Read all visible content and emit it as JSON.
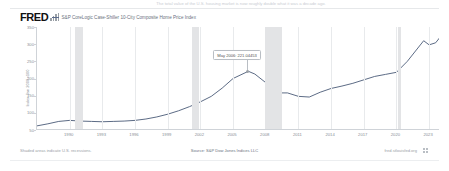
{
  "top_caption": "The total value of the U.S. housing market is now roughly double what it was a decade ago.",
  "header": {
    "logo_text": "FRED",
    "logo_icon": "bar-chart-icon",
    "legend": [
      {
        "label": "S&P CoreLogic Case-Shiller 10-City Composite Home Price Index",
        "color": "#5b6b8c"
      }
    ]
  },
  "annotation": {
    "text": "May 2006: 221.04453"
  },
  "footer": {
    "left": "Shaded areas indicate U.S. recessions.",
    "center": "Source: S&P Dow Jones Indices LLC",
    "right": "fred.stlouisfed.org",
    "icon": "fred-grid-icon"
  },
  "chart_data": {
    "type": "line",
    "title": "S&P CoreLogic Case-Shiller 10-City Composite Home Price Index",
    "xlabel": "",
    "ylabel": "Index Jan 2000=100",
    "ylim": [
      50,
      350
    ],
    "yticks": [
      50,
      100,
      150,
      200,
      250,
      300,
      350
    ],
    "xlim": [
      1987,
      2024
    ],
    "xticks": [
      1990,
      1993,
      1996,
      1999,
      2002,
      2005,
      2008,
      2011,
      2014,
      2017,
      2020,
      2023
    ],
    "xtick_labels": [
      "1990",
      "1993",
      "1996",
      "1999",
      "2002",
      "2005",
      "2008",
      "2011",
      "2014",
      "2017",
      "2020",
      "2023"
    ],
    "grid": true,
    "legend_position": "top",
    "recessions": [
      {
        "start": 1990.5,
        "end": 1991.2
      },
      {
        "start": 2001.2,
        "end": 2001.9
      },
      {
        "start": 2007.9,
        "end": 2009.5
      },
      {
        "start": 2020.1,
        "end": 2020.4
      }
    ],
    "series": [
      {
        "name": "S&P CoreLogic Case-Shiller 10-City Composite Home Price Index",
        "color": "#4a5a77",
        "x": [
          1987,
          1988,
          1989,
          1990,
          1991,
          1992,
          1993,
          1994,
          1995,
          1996,
          1997,
          1998,
          1999,
          2000,
          2001,
          2002,
          2003,
          2004,
          2005,
          2006.4,
          2007,
          2008,
          2009,
          2010,
          2011,
          2012,
          2013,
          2014,
          2015,
          2016,
          2017,
          2018,
          2019,
          2020,
          2021,
          2022.5,
          2023,
          2023.6,
          2024
        ],
        "y": [
          62,
          68,
          75,
          78,
          76,
          75,
          74,
          75,
          76,
          78,
          82,
          88,
          96,
          106,
          118,
          132,
          148,
          172,
          200,
          221,
          213,
          188,
          158,
          158,
          148,
          146,
          160,
          171,
          178,
          186,
          196,
          206,
          212,
          218,
          250,
          310,
          298,
          304,
          320
        ],
        "annotations": [
          {
            "x": 2006.4,
            "y": 221,
            "label": "May 2006: 221.04453"
          }
        ]
      }
    ]
  }
}
